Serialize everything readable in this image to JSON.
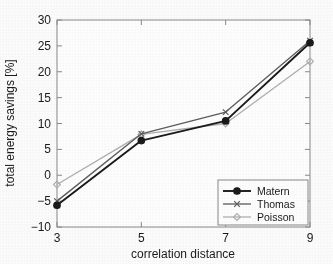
{
  "chart_data": {
    "type": "line",
    "title": "",
    "xlabel": "correlation distance",
    "ylabel": "total energy savings [%]",
    "x": [
      3,
      5,
      7,
      9
    ],
    "xticklabels": [
      "3",
      "5",
      "7",
      "9"
    ],
    "yticklabels": [
      "-10",
      "-5",
      "0",
      "5",
      "10",
      "15",
      "20",
      "25",
      "30"
    ],
    "yticks": [
      -10,
      -5,
      0,
      5,
      10,
      15,
      20,
      25,
      30
    ],
    "xlim": [
      3,
      9
    ],
    "ylim": [
      -10,
      30
    ],
    "grid": false,
    "legend_position": "lower right",
    "series": [
      {
        "name": "Matern",
        "values": [
          -5.8,
          6.7,
          10.5,
          25.6
        ],
        "color": "#1a1a1a",
        "marker": "circle"
      },
      {
        "name": "Thomas",
        "values": [
          -5.0,
          8.0,
          12.2,
          26.0
        ],
        "color": "#5c5c5c",
        "marker": "x"
      },
      {
        "name": "Poisson",
        "values": [
          -1.8,
          7.9,
          10.0,
          22.0
        ],
        "color": "#b0b0b0",
        "marker": "diamond"
      }
    ]
  },
  "axes": {
    "frame_color": "#8a8a8a",
    "text_color": "#1a1a1a"
  },
  "legend": {
    "entries": [
      "Matern",
      "Thomas",
      "Poisson"
    ],
    "border_color": "#8a8a8a",
    "background": "#ffffff"
  }
}
